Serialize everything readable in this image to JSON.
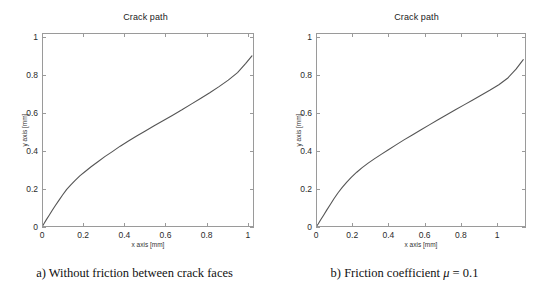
{
  "figure": {
    "width": 539,
    "height": 287,
    "background": "#ffffff",
    "line_color": "#555555"
  },
  "panels": [
    {
      "id": "panel-a",
      "title": "Crack path",
      "caption_prefix": "a) Without friction between crack faces",
      "xlabel": "x axis [mm]",
      "ylabel": "y axis [mm]"
    },
    {
      "id": "panel-b",
      "title": "Crack path",
      "caption_prefix": "b) Friction coefficient ",
      "caption_mu": "μ",
      "caption_suffix": " = 0.1",
      "xlabel": "x axis [mm]",
      "ylabel": "y axis [mm]"
    }
  ],
  "chart_data": [
    {
      "type": "line",
      "title": "Crack path",
      "xlabel": "x axis [mm]",
      "ylabel": "y axis [mm]",
      "xlim": [
        0,
        1.03
      ],
      "ylim": [
        0,
        1.02
      ],
      "xticks": [
        0,
        0.2,
        0.4,
        0.6,
        0.8,
        1
      ],
      "xticklabels": [
        "0",
        "0.2",
        "0.4",
        "0.6",
        "0.8",
        "1"
      ],
      "yticks": [
        0,
        0.2,
        0.4,
        0.6,
        0.8,
        1
      ],
      "yticklabels": [
        "0",
        "0.2",
        "0.4",
        "0.6",
        "0.8",
        "1"
      ],
      "grid": false,
      "legend": null,
      "series": [
        {
          "name": "crack path (no friction)",
          "color": "#555555",
          "x": [
            0.0,
            0.01,
            0.022,
            0.035,
            0.05,
            0.065,
            0.082,
            0.1,
            0.12,
            0.14,
            0.16,
            0.185,
            0.21,
            0.24,
            0.27,
            0.305,
            0.34,
            0.38,
            0.42,
            0.46,
            0.5,
            0.545,
            0.59,
            0.635,
            0.68,
            0.725,
            0.77,
            0.815,
            0.86,
            0.905,
            0.95,
            0.99,
            1.02
          ],
          "y": [
            0.0,
            0.018,
            0.04,
            0.062,
            0.088,
            0.113,
            0.14,
            0.168,
            0.198,
            0.222,
            0.244,
            0.27,
            0.292,
            0.318,
            0.342,
            0.37,
            0.395,
            0.425,
            0.452,
            0.478,
            0.503,
            0.532,
            0.56,
            0.588,
            0.616,
            0.646,
            0.676,
            0.706,
            0.738,
            0.772,
            0.812,
            0.86,
            0.9
          ]
        }
      ]
    },
    {
      "type": "line",
      "title": "Crack path",
      "xlabel": "x axis [mm]",
      "ylabel": "y axis [mm]",
      "xlim": [
        0,
        1.16
      ],
      "ylim": [
        0,
        1.02
      ],
      "xticks": [
        0,
        0.2,
        0.4,
        0.6,
        0.8,
        1
      ],
      "xticklabels": [
        "0",
        "0.2",
        "0.4",
        "0.6",
        "0.8",
        "1"
      ],
      "yticks": [
        0,
        0.2,
        0.4,
        0.6,
        0.8,
        1
      ],
      "yticklabels": [
        "0",
        "0.2",
        "0.4",
        "0.6",
        "0.8",
        "1"
      ],
      "grid": false,
      "legend": null,
      "series": [
        {
          "name": "crack path (mu = 0.1)",
          "color": "#555555",
          "x": [
            0.0,
            0.012,
            0.026,
            0.042,
            0.06,
            0.08,
            0.1,
            0.122,
            0.145,
            0.17,
            0.196,
            0.225,
            0.255,
            0.288,
            0.322,
            0.36,
            0.4,
            0.442,
            0.486,
            0.532,
            0.578,
            0.626,
            0.674,
            0.722,
            0.77,
            0.818,
            0.866,
            0.914,
            0.962,
            1.01,
            1.058,
            1.105,
            1.145
          ],
          "y": [
            0.0,
            0.016,
            0.038,
            0.062,
            0.09,
            0.12,
            0.15,
            0.18,
            0.208,
            0.236,
            0.262,
            0.288,
            0.312,
            0.336,
            0.358,
            0.382,
            0.406,
            0.432,
            0.458,
            0.484,
            0.51,
            0.537,
            0.564,
            0.59,
            0.616,
            0.642,
            0.668,
            0.694,
            0.72,
            0.748,
            0.782,
            0.83,
            0.88
          ]
        }
      ]
    }
  ]
}
